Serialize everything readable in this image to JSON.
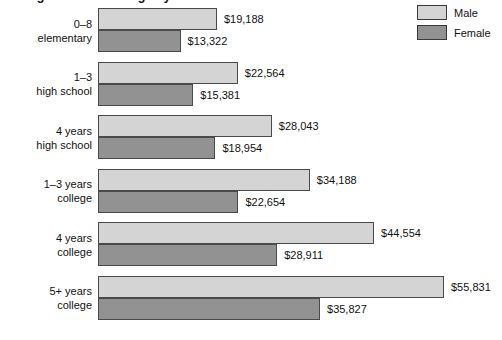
{
  "chart_data": {
    "type": "bar",
    "orientation": "horizontal",
    "title": "Average annual earnings by educational attainment",
    "xlabel": "",
    "ylabel": "",
    "grid": false,
    "legend_position": "top-right",
    "value_prefix": "$",
    "axis_start": 0,
    "max_value": 55831,
    "categories": [
      "0–8 elementary",
      "1–3 high school",
      "4 years high school",
      "1–3 years college",
      "4 years college",
      "5+ years college"
    ],
    "series": [
      {
        "name": "Male",
        "color": "#d4d4d4",
        "values": [
          19188,
          22564,
          28043,
          34188,
          44554,
          55831
        ]
      },
      {
        "name": "Female",
        "color": "#929292",
        "values": [
          13322,
          15381,
          18954,
          22654,
          28911,
          35827
        ]
      }
    ]
  },
  "legend": {
    "items": [
      {
        "label": "Male",
        "swatch": "male"
      },
      {
        "label": "Female",
        "swatch": "female"
      }
    ]
  },
  "groups": [
    {
      "label_line1": "0–8",
      "label_line2": "elementary",
      "male_value": 19188,
      "male_value_label": "$19,188",
      "female_value": 13322,
      "female_value_label": "$13,322"
    },
    {
      "label_line1": "1–3",
      "label_line2": "high school",
      "male_value": 22564,
      "male_value_label": "$22,564",
      "female_value": 15381,
      "female_value_label": "$15,381"
    },
    {
      "label_line1": "4 years",
      "label_line2": "high school",
      "male_value": 28043,
      "male_value_label": "$28,043",
      "female_value": 18954,
      "female_value_label": "$18,954"
    },
    {
      "label_line1": "1–3 years",
      "label_line2": "college",
      "male_value": 34188,
      "male_value_label": "$34,188",
      "female_value": 22654,
      "female_value_label": "$22,654"
    },
    {
      "label_line1": "4 years",
      "label_line2": "college",
      "male_value": 44554,
      "male_value_label": "$44,554",
      "female_value": 28911,
      "female_value_label": "$28,911"
    },
    {
      "label_line1": "5+ years",
      "label_line2": "college",
      "male_value": 55831,
      "male_value_label": "$55,831",
      "female_value": 35827,
      "female_value_label": "$35,827"
    }
  ]
}
